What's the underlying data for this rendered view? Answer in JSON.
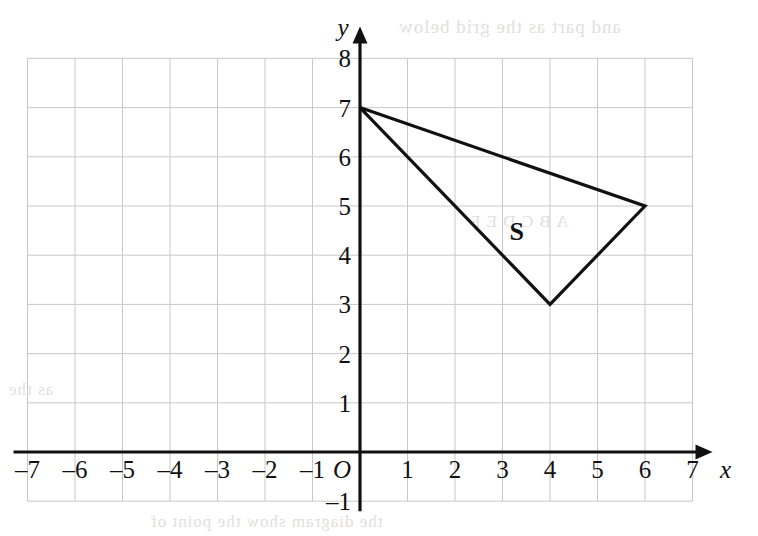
{
  "chart_data": {
    "type": "scatter",
    "title": "",
    "subtitle": "",
    "xlabel": "x",
    "ylabel": "y",
    "xlim": [
      -7,
      7
    ],
    "ylim": [
      -1,
      8
    ],
    "grid": true,
    "grid_step": 1,
    "legend": "none",
    "origin_label": "O",
    "x_ticks": [
      -7,
      -6,
      -5,
      -4,
      -3,
      -2,
      -1,
      1,
      2,
      3,
      4,
      5,
      6,
      7
    ],
    "y_ticks": [
      -1,
      1,
      2,
      3,
      4,
      5,
      6,
      7,
      8
    ],
    "x_tick_labels": [
      "–7",
      "–6",
      "–5",
      "–4",
      "–3",
      "–2",
      "–1",
      "1",
      "2",
      "3",
      "4",
      "5",
      "6",
      "7"
    ],
    "y_tick_labels": [
      "–1",
      "1",
      "2",
      "3",
      "4",
      "5",
      "6",
      "7",
      "8"
    ],
    "axis_arrows": [
      "x-positive",
      "y-positive"
    ],
    "shapes": [
      {
        "name": "S",
        "label": "S",
        "type": "triangle",
        "filled": false,
        "stroke": "#111111",
        "vertices": [
          [
            0,
            7
          ],
          [
            6,
            5
          ],
          [
            4,
            3
          ]
        ],
        "label_position": [
          3.3,
          4.5
        ]
      }
    ],
    "colors": {
      "grid": "#c8c8c8",
      "axis": "#111111",
      "shape_stroke": "#111111",
      "background": "#ffffff"
    }
  },
  "background_artifacts": {
    "note": "faint scanner bleed-through from reverse page",
    "top": "and part as the grid below",
    "left": "as the",
    "mid": "A B C D E F",
    "bottom": "the diagram show the point of"
  }
}
